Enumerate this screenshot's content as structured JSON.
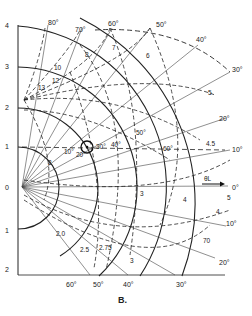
{
  "figure": {
    "caption": "B.",
    "axis_arrow_label": "θL",
    "y_axis_ticks": [
      "4",
      "3",
      "2",
      "1",
      "0",
      "1",
      "2"
    ],
    "upper_angle_labels": [
      "80°",
      "70°",
      "60°",
      "50°",
      "40°",
      "30°",
      "20°",
      "10°",
      "0°"
    ],
    "lower_angle_labels": [
      "10°",
      "20°",
      "30°",
      "40°",
      "50°",
      "60°"
    ],
    "inner_angle_labels": [
      "10°",
      "20°",
      "30°",
      "40°",
      "50°",
      "60°"
    ],
    "curve_labels_upper": [
      "8",
      "7",
      "6",
      "5",
      "4.5",
      "4",
      "10",
      "12",
      "13"
    ],
    "curve_labels_lower": [
      "2.0",
      "2.5",
      "2.75",
      "3",
      "70"
    ],
    "arc_labels": [
      "2",
      "3",
      "4",
      "5"
    ]
  }
}
